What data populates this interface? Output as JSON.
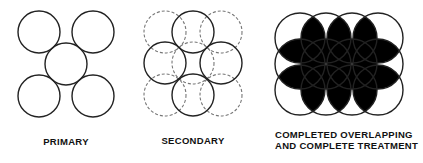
{
  "figure": {
    "panels": [
      {
        "id": "primary",
        "label_lines": [
          "PRIMARY"
        ],
        "circle_radius": 21,
        "circles": [
          {
            "cx": 39,
            "cy": 32,
            "style": "solid"
          },
          {
            "cx": 93,
            "cy": 32,
            "style": "solid"
          },
          {
            "cx": 66,
            "cy": 64,
            "style": "solid"
          },
          {
            "cx": 39,
            "cy": 96,
            "style": "solid"
          },
          {
            "cx": 93,
            "cy": 96,
            "style": "solid"
          }
        ]
      },
      {
        "id": "secondary",
        "label_lines": [
          "SECONDARY"
        ],
        "circle_radius": 21,
        "circles": [
          {
            "cx": 165,
            "cy": 32,
            "style": "dashed"
          },
          {
            "cx": 221,
            "cy": 32,
            "style": "dashed"
          },
          {
            "cx": 193,
            "cy": 63,
            "style": "dashed"
          },
          {
            "cx": 165,
            "cy": 95,
            "style": "dashed"
          },
          {
            "cx": 221,
            "cy": 95,
            "style": "dashed"
          },
          {
            "cx": 193,
            "cy": 32,
            "style": "solid"
          },
          {
            "cx": 165,
            "cy": 63,
            "style": "solid"
          },
          {
            "cx": 221,
            "cy": 63,
            "style": "solid"
          },
          {
            "cx": 193,
            "cy": 95,
            "style": "solid"
          }
        ]
      },
      {
        "id": "completed",
        "label_lines": [
          "COMPLETED OVERLAPPING",
          "AND COMPLETE TREATMENT"
        ],
        "circle_radius": 25,
        "grid": {
          "columns_x": [
            300,
            326,
            352,
            378
          ],
          "rows_y": [
            38,
            64,
            90
          ]
        },
        "overlap_fill": "#000000"
      }
    ],
    "colors": {
      "stroke": "#222222",
      "dashed_stroke": "#777777",
      "background": "#ffffff"
    }
  }
}
